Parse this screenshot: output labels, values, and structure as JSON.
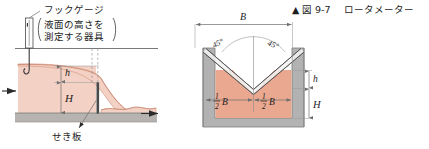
{
  "figure": {
    "caption_marker": "▲",
    "caption_number": "図 9-7",
    "caption_title": "ロータメーター"
  },
  "left_diagram": {
    "name": "weir-side-view",
    "hook_gauge_label": "フックゲージ",
    "hook_gauge_note_line1": "液面の高さを",
    "hook_gauge_note_line2": "測定する器具",
    "weir_plate_label": "せき板",
    "dim_h": "h",
    "dim_H": "H",
    "flow_in_arrow": "flow-arrow-left",
    "flow_out_arrow": "flow-arrow-right"
  },
  "right_diagram": {
    "name": "v-notch-front-view",
    "dim_B": "B",
    "angle_left": "45°",
    "angle_right": "45°",
    "half_B_numerator": "1",
    "half_B_denominator": "2",
    "half_B_symbol": "B",
    "dim_h": "h",
    "dim_H": "H"
  },
  "colors": {
    "water": "#f3d2c5",
    "water_dark": "#e9a88f",
    "ground": "#b6b3b0",
    "wall": "#b3b2b2",
    "line": "#3b3b3b",
    "thin_line": "#8c8c8c",
    "text": "#1d1d1d"
  }
}
